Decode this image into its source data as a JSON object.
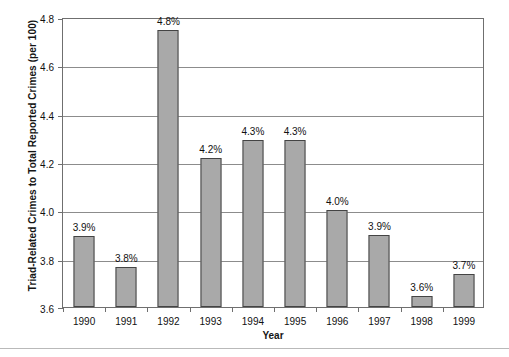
{
  "chart_data": {
    "type": "bar",
    "title": "",
    "xlabel": "Year",
    "ylabel": "Triad-Related Crimes to Total Reported Crimes (per 100)",
    "categories": [
      "1990",
      "1991",
      "1992",
      "1993",
      "1994",
      "1995",
      "1996",
      "1997",
      "1998",
      "1999"
    ],
    "values": [
      3.895,
      3.765,
      4.745,
      4.215,
      4.29,
      4.29,
      4.0,
      3.9,
      3.645,
      3.735
    ],
    "data_labels": [
      "3.9%",
      "3.8%",
      "4.8%",
      "4.2%",
      "4.3%",
      "4.3%",
      "4.0%",
      "3.9%",
      "3.6%",
      "3.7%"
    ],
    "ylim": [
      3.6,
      4.8
    ],
    "ytick_values": [
      3.6,
      3.8,
      4.0,
      4.2,
      4.4,
      4.6,
      4.8
    ],
    "ytick_labels": [
      "3.6",
      "3.8",
      "4.0",
      "4.2",
      "4.4",
      "4.6",
      "4.8"
    ],
    "grid": true,
    "legend": "none",
    "bar_color": "#a9a9a9",
    "bar_edge_color": "#444444",
    "grid_color": "#8c8c8c",
    "axis_color": "#6f6f6f"
  }
}
